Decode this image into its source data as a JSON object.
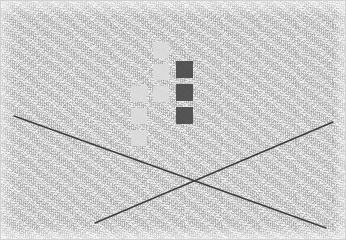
{
  "scene": {
    "title": "noisy-texture-blocks-and-crossing-lines",
    "width": 346,
    "height": 240,
    "background_color": "#f1f1f1",
    "border_color": "#d2d2d2",
    "texture": "grainy-noise"
  },
  "palette": {
    "light_block": "#dcdcdc",
    "dark_block": "#4a4a4a",
    "line": "#3c3c3c",
    "background": "#f1f1f1"
  },
  "blocks": {
    "size": 16,
    "light_label": "light-gray-block",
    "dark_label": "dark-gray-block",
    "items": [
      {
        "id": "light-1",
        "tone": "light",
        "color": "#dcdcdc",
        "x": 153,
        "y": 42,
        "w": 16,
        "h": 16,
        "column": "middle",
        "row": 1
      },
      {
        "id": "light-2",
        "tone": "light",
        "color": "#dcdcdc",
        "x": 153,
        "y": 64,
        "w": 16,
        "h": 16,
        "column": "middle",
        "row": 2
      },
      {
        "id": "light-3",
        "tone": "light",
        "color": "#dcdcdc",
        "x": 153,
        "y": 86,
        "w": 16,
        "h": 16,
        "column": "middle",
        "row": 3
      },
      {
        "id": "light-4",
        "tone": "light",
        "color": "#dcdcdc",
        "x": 131,
        "y": 86,
        "w": 16,
        "h": 16,
        "column": "left",
        "row": 3
      },
      {
        "id": "light-5",
        "tone": "light",
        "color": "#dcdcdc",
        "x": 131,
        "y": 108,
        "w": 16,
        "h": 16,
        "column": "left",
        "row": 4
      },
      {
        "id": "light-6",
        "tone": "light",
        "color": "#dcdcdc",
        "x": 131,
        "y": 130,
        "w": 16,
        "h": 16,
        "column": "left",
        "row": 5
      },
      {
        "id": "dark-1",
        "tone": "dark",
        "color": "#4a4a4a",
        "x": 176,
        "y": 61,
        "w": 17,
        "h": 17,
        "column": "right",
        "row": 1
      },
      {
        "id": "dark-2",
        "tone": "dark",
        "color": "#4a4a4a",
        "x": 176,
        "y": 84,
        "w": 17,
        "h": 17,
        "column": "right",
        "row": 2
      },
      {
        "id": "dark-3",
        "tone": "dark",
        "color": "#4a4a4a",
        "x": 176,
        "y": 107,
        "w": 17,
        "h": 17,
        "column": "right",
        "row": 3
      }
    ]
  },
  "lines": {
    "stroke_color": "#3c3c3c",
    "stroke_width": 1.4,
    "intersection": {
      "x": 190,
      "y": 182
    },
    "items": [
      {
        "id": "line-descending",
        "label": "descending-diagonal-line",
        "x1": 14,
        "y1": 116,
        "x2": 326,
        "y2": 228
      },
      {
        "id": "line-ascending",
        "label": "ascending-diagonal-line",
        "x1": 95,
        "y1": 223,
        "x2": 333,
        "y2": 122
      }
    ]
  }
}
